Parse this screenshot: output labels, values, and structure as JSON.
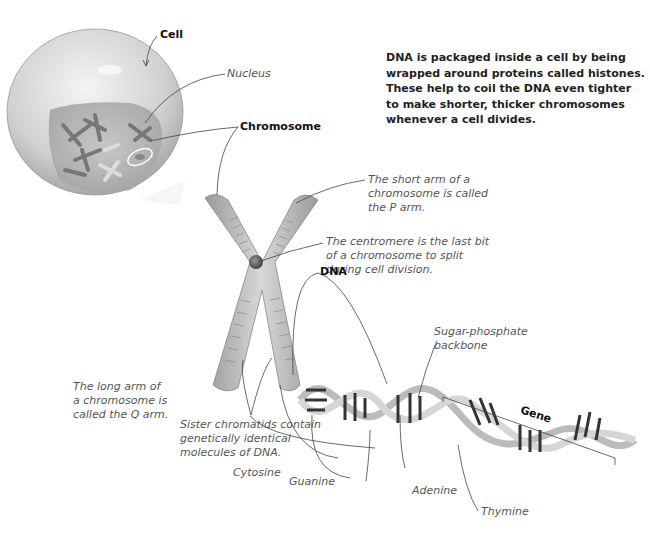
{
  "intro_text": "DNA is packaged inside a cell by being wrapped around proteins called histones. These help to coil the DNA even tighter to make shorter, thicker chromosomes whenever a cell divides.",
  "labels": {
    "cell": "Cell",
    "nucleus": "Nucleus",
    "chromosome": "Chromosome",
    "dna": "DNA",
    "gene": "Gene",
    "p_arm": [
      "The short arm of a",
      "chromosome is called",
      "the P arm."
    ],
    "centromere": [
      "The centromere is the last bit",
      "of a chromosome to split",
      "during cell division."
    ],
    "q_arm": [
      "The long arm of",
      "a chromosome is",
      "called the Q arm."
    ],
    "sister_chromatids": [
      "Sister chromatids contain",
      "genetically identical",
      "molecules of DNA."
    ],
    "backbone": [
      "Sugar-phosphate",
      "backbone"
    ],
    "cytosine": "Cytosine",
    "guanine": "Guanine",
    "adenine": "Adenine",
    "thymine": "Thymine"
  }
}
